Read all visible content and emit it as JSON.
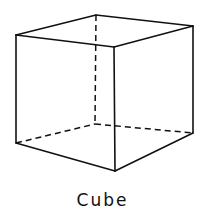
{
  "diagram": {
    "title": "Cube",
    "stroke_color": "#111111",
    "background": "#ffffff",
    "vertices": {
      "front_top_left": [
        16,
        35
      ],
      "front_top_right": [
        114,
        47
      ],
      "back_top_left": [
        96,
        15
      ],
      "back_top_right": [
        193,
        26
      ],
      "front_bottom_left": [
        16,
        143
      ],
      "front_bottom_right": [
        115,
        171
      ],
      "back_bottom_left": [
        95,
        124
      ],
      "back_bottom_right": [
        193,
        133
      ]
    },
    "edges_solid": 9,
    "edges_hidden_dashed": 3
  }
}
